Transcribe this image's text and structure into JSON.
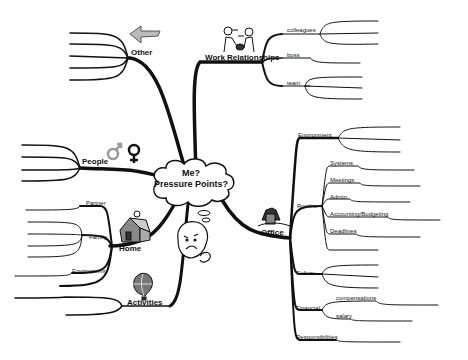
{
  "center": {
    "line1": "Me?",
    "line2": "Pressure Points?"
  },
  "branches": {
    "work": {
      "label": "Work Relationships",
      "icon": "handshake-people-icon",
      "children": [
        "colleagues",
        "boss",
        "team"
      ]
    },
    "other": {
      "label": "Other",
      "icon": "left-arrow-icon"
    },
    "people": {
      "label": "People",
      "icon": "male-female-symbols-icon"
    },
    "home": {
      "label": "Home",
      "icon": "house-icon",
      "children": [
        "Partner",
        "Family",
        "Environment"
      ]
    },
    "activities": {
      "label": "Activities",
      "icon": "hot-air-balloon-icon"
    },
    "office": {
      "label": "Office",
      "icon": "office-building-icon",
      "children": [
        "Environment",
        "Routine",
        "Culture",
        "Financial",
        "Responsibilities"
      ],
      "routine": [
        "Systems",
        "Meetings",
        "Admin",
        "Accounting/Budgeting",
        "Deadlines"
      ],
      "financial": [
        "compensations",
        "salary"
      ]
    }
  },
  "colors": {
    "line": "#111111",
    "balloon": "#777777",
    "male": "#999999"
  }
}
